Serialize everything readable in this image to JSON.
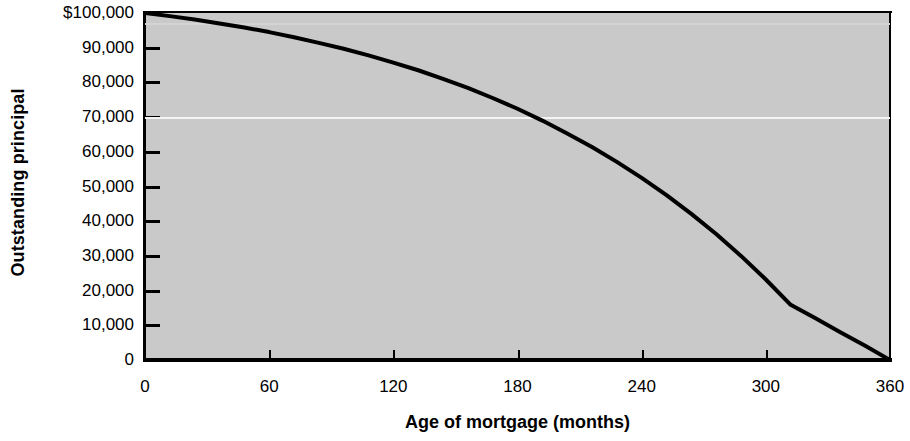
{
  "chart_data": {
    "type": "line",
    "title": "",
    "xlabel": "Age of mortgage (months)",
    "ylabel": "Outstanding principal",
    "xlim": [
      0,
      360
    ],
    "ylim": [
      0,
      100000
    ],
    "grid": "single white horizontal rule near 70,000",
    "legend": "none",
    "x_ticks": [
      0,
      60,
      120,
      180,
      240,
      300,
      360
    ],
    "x_tick_labels": [
      "0",
      "60",
      "120",
      "180",
      "240",
      "300",
      "360"
    ],
    "y_ticks": [
      0,
      10000,
      20000,
      30000,
      40000,
      50000,
      60000,
      70000,
      80000,
      90000,
      100000
    ],
    "y_tick_labels": [
      "0",
      "10,000",
      "20,000",
      "30,000",
      "40,000",
      "50,000",
      "60,000",
      "70,000",
      "80,000",
      "90,000",
      "$100,000"
    ],
    "series": [
      {
        "name": "Outstanding principal",
        "color": "#000000",
        "x": [
          0,
          12,
          24,
          36,
          48,
          60,
          72,
          84,
          96,
          108,
          120,
          132,
          144,
          156,
          168,
          180,
          192,
          204,
          216,
          228,
          240,
          252,
          264,
          276,
          288,
          300,
          312,
          324,
          336,
          348,
          360
        ],
        "values": [
          100000,
          99100,
          98100,
          97000,
          95800,
          94500,
          93000,
          91400,
          89700,
          87800,
          85700,
          83500,
          81000,
          78400,
          75500,
          72400,
          69000,
          65300,
          61400,
          57100,
          52500,
          47500,
          42100,
          36300,
          30000,
          23200,
          15900,
          12000,
          8000,
          4100,
          0
        ]
      }
    ],
    "annotations": []
  },
  "colors": {
    "plot_background": "#c9c9c9",
    "page_background": "#ffffff",
    "axis": "#000000",
    "curve": "#000000",
    "gridline": "#f4f4f4"
  },
  "axis_titles": {
    "x": "Age of mortgage (months)",
    "y": "Outstanding principal"
  }
}
